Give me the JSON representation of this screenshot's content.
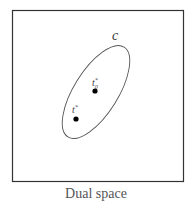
{
  "diagram": {
    "caption": "Dual space",
    "region_label": "c",
    "points": [
      {
        "label": "t*",
        "base": "t",
        "sup": "*",
        "sub": "",
        "x": 76,
        "y": 119
      },
      {
        "label": "t0*",
        "base": "t",
        "sup": "*",
        "sub": "0",
        "x": 95,
        "y": 91
      }
    ],
    "colors": {
      "stroke": "#333333",
      "ellipse": "#555555",
      "point": "#000000",
      "caption": "#555555"
    }
  }
}
